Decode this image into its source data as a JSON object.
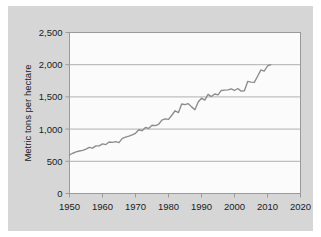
{
  "figure": {
    "background_color": "#ffffff",
    "panel_color": "#d6d6d6",
    "plot_area_color": "#fbfbfb",
    "axis_color": "#9a9a9a",
    "gridline_color": "#a8a8a8",
    "line_color": "#8c8c8c"
  },
  "chart_data": {
    "type": "line",
    "title": "",
    "subtitle": "",
    "xlabel": "",
    "ylabel": "Metric tons per hectare",
    "xlim": [
      1950,
      2020
    ],
    "ylim": [
      0,
      2500
    ],
    "xticks": [
      1950,
      1960,
      1970,
      1980,
      1990,
      2000,
      2010,
      2020
    ],
    "xtick_labels": [
      "1950",
      "1960",
      "1970",
      "1980",
      "1990",
      "2000",
      "2010",
      "2020"
    ],
    "yticks": [
      0,
      500,
      1000,
      1500,
      2000,
      2500
    ],
    "ytick_labels": [
      "0",
      "500",
      "1,000",
      "1,500",
      "2,000",
      "2,500"
    ],
    "grid": "horizontal",
    "legend": "none",
    "annotations": [],
    "series": [
      {
        "name": "Cereal yield",
        "color": "#8c8c8c",
        "x": [
          1950,
          1951,
          1952,
          1953,
          1954,
          1955,
          1956,
          1957,
          1958,
          1959,
          1960,
          1961,
          1962,
          1963,
          1964,
          1965,
          1966,
          1967,
          1968,
          1969,
          1970,
          1971,
          1972,
          1973,
          1974,
          1975,
          1976,
          1977,
          1978,
          1979,
          1980,
          1981,
          1982,
          1983,
          1984,
          1985,
          1986,
          1987,
          1988,
          1989,
          1990,
          1991,
          1992,
          1993,
          1994,
          1995,
          1996,
          1997,
          1998,
          1999,
          2000,
          2001,
          2002,
          2003,
          2004,
          2005,
          2006,
          2007,
          2008,
          2009,
          2010,
          2011
        ],
        "values": [
          600,
          625,
          645,
          660,
          670,
          690,
          715,
          705,
          740,
          740,
          770,
          760,
          800,
          795,
          805,
          790,
          855,
          875,
          890,
          910,
          935,
          990,
          975,
          1025,
          1010,
          1060,
          1055,
          1075,
          1140,
          1160,
          1150,
          1215,
          1285,
          1255,
          1390,
          1380,
          1395,
          1345,
          1300,
          1420,
          1480,
          1450,
          1540,
          1505,
          1545,
          1530,
          1600,
          1605,
          1610,
          1625,
          1600,
          1630,
          1590,
          1595,
          1740,
          1730,
          1725,
          1820,
          1920,
          1900,
          1980,
          2000
        ]
      }
    ]
  },
  "y_axis": {
    "title": "Metric tons per hectare"
  }
}
